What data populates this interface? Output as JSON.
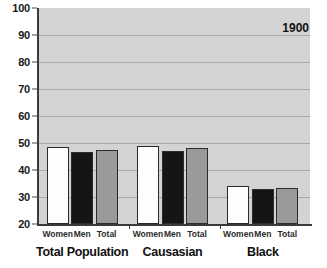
{
  "chart_data": {
    "type": "bar",
    "title": "",
    "subtitle": "",
    "xlabel": "",
    "ylabel": "",
    "ylim": [
      20,
      100
    ],
    "yticks": [
      20,
      30,
      40,
      50,
      60,
      70,
      80,
      90,
      100
    ],
    "ytick_labels": [
      "20",
      "30",
      "40",
      "50",
      "60",
      "70",
      "80",
      "90",
      "100"
    ],
    "grid": true,
    "legend": "none",
    "annotations": [
      {
        "text": "1900",
        "position": "top-right"
      }
    ],
    "categories": [
      "Women",
      "Men",
      "Total"
    ],
    "groups": [
      {
        "name": "Total Population",
        "bars": [
          {
            "label": "Women",
            "value": 48.5,
            "style": "white"
          },
          {
            "label": "Men",
            "value": 46.5,
            "style": "black"
          },
          {
            "label": "Total",
            "value": 47.5,
            "style": "gray"
          }
        ]
      },
      {
        "name": "Causasian",
        "bars": [
          {
            "label": "Women",
            "value": 49.0,
            "style": "white"
          },
          {
            "label": "Men",
            "value": 47.0,
            "style": "black"
          },
          {
            "label": "Total",
            "value": 48.0,
            "style": "gray"
          }
        ]
      },
      {
        "name": "Black",
        "bars": [
          {
            "label": "Women",
            "value": 34.0,
            "style": "white"
          },
          {
            "label": "Men",
            "value": 33.0,
            "style": "black"
          },
          {
            "label": "Total",
            "value": 33.5,
            "style": "gray"
          }
        ]
      }
    ],
    "series": [
      {
        "name": "Women",
        "values": [
          48.5,
          49.0,
          34.0
        ]
      },
      {
        "name": "Men",
        "values": [
          46.5,
          47.0,
          33.0
        ]
      },
      {
        "name": "Total",
        "values": [
          47.5,
          48.0,
          33.5
        ]
      }
    ]
  },
  "colors": {
    "plot_background": "#d3d3d3",
    "page_background": "#ffffff",
    "gridline": "#a8a8a8",
    "axis": "#3a3a3a",
    "bar_white": "#fdfdfd",
    "bar_black": "#151515",
    "bar_gray": "#9a9a9a",
    "bar_outline": "#2b2b2b",
    "text": "#111111"
  }
}
